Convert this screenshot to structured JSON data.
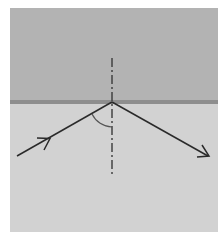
{
  "diagram": {
    "type": "optics-ray-reflection",
    "colors": {
      "background": "#ffffff",
      "upper_medium": "#b3b3b3",
      "lower_medium": "#d2d2d2",
      "interface": "#8e8e8e",
      "ray": "#2a2a2a",
      "normal": "#3a3a3a"
    },
    "interface_y": 102,
    "normal_x": 112,
    "incident_ray": {
      "from": [
        17,
        156
      ],
      "to": [
        112,
        102
      ],
      "arrow_at": [
        45,
        140
      ]
    },
    "reflected_ray": {
      "from": [
        112,
        102
      ],
      "to": [
        208,
        156
      ]
    },
    "angle_arc": {
      "label": "angle of incidence",
      "radius": 24
    },
    "normal_line": {
      "top_y": 58,
      "bottom_y": 175,
      "style": "dash-dot"
    }
  }
}
